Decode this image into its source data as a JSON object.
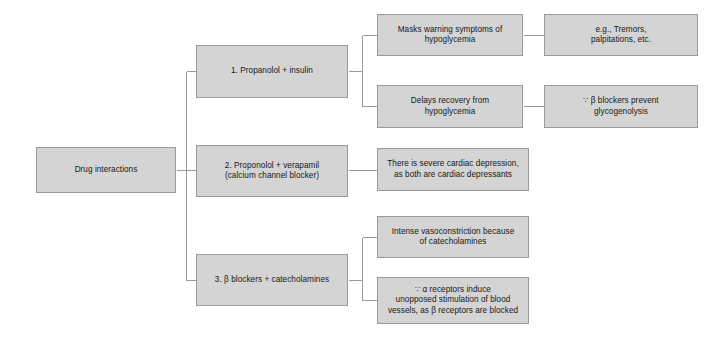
{
  "diagram": {
    "type": "hierarchy-flowchart",
    "title": "Drug interactions",
    "colors": {
      "node_fill": "#d4d4d4",
      "node_border": "#9a9a9a",
      "connector": "#9a9a9a",
      "background": "#ffffff",
      "text": "#171717"
    },
    "nodes": {
      "root": "Drug interactions",
      "branch1": "1. Propanolol + insulin",
      "branch2": "2. Proponolol + verapamil\n(calcium channel blocker)",
      "branch3": "3. β blockers + catecholamines",
      "b1_effect1": "Masks warning symptoms of\nhypoglycemia",
      "b1_effect2": "Delays recovery from\nhypoglycemia",
      "b1_effect1_detail": "e.g., Tremors,\npalpitations, etc.",
      "b1_effect2_detail": "∵ β blockers prevent\nglycogenolysis",
      "b2_effect1": "There is severe cardiac depression,\nas both are cardiac depressants",
      "b3_effect1": "Intense vasoconstriction because\nof catecholamines",
      "b3_effect2": "∵ α receptors induce\nunopposed stimulation of blood\nvessels, as β receptors are blocked"
    },
    "edges": [
      {
        "from": "root",
        "to": "branch1"
      },
      {
        "from": "root",
        "to": "branch2"
      },
      {
        "from": "root",
        "to": "branch3"
      },
      {
        "from": "branch1",
        "to": "b1_effect1"
      },
      {
        "from": "branch1",
        "to": "b1_effect2"
      },
      {
        "from": "b1_effect1",
        "to": "b1_effect1_detail"
      },
      {
        "from": "b1_effect2",
        "to": "b1_effect2_detail"
      },
      {
        "from": "branch2",
        "to": "b2_effect1"
      },
      {
        "from": "branch3",
        "to": "b3_effect1"
      },
      {
        "from": "branch3",
        "to": "b3_effect2"
      }
    ]
  }
}
